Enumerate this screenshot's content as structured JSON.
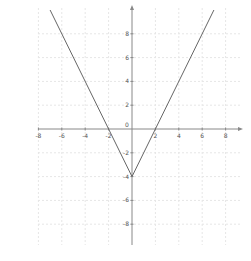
{
  "chart_data": {
    "type": "line",
    "title": "",
    "xlabel": "",
    "ylabel": "",
    "function": "y = 2|x| - 4",
    "series": [
      {
        "name": "y = 2|x| - 4",
        "x": [
          -7,
          -2,
          0,
          2,
          7
        ],
        "y": [
          10,
          0,
          -4,
          0,
          10
        ]
      }
    ],
    "key_points": {
      "vertex": [
        0,
        -4
      ],
      "x_intercepts": [
        [
          -2,
          0
        ],
        [
          2,
          0
        ]
      ],
      "y_intercept": [
        0,
        -4
      ]
    },
    "xlim": [
      -10,
      10
    ],
    "ylim": [
      -10,
      10
    ],
    "x_ticks": [
      -8,
      -6,
      -4,
      -2,
      2,
      4,
      6,
      8
    ],
    "y_ticks": [
      8,
      6,
      4,
      2,
      -2,
      -4,
      -6,
      -8
    ],
    "x_tick_labels": [
      "-8",
      "-6",
      "-4",
      "-2",
      "2",
      "4",
      "6",
      "8"
    ],
    "y_tick_labels": [
      "8",
      "6",
      "4",
      "2",
      "-2",
      "-4",
      "-6",
      "-8"
    ],
    "origin_label": "0",
    "grid": true,
    "legend": "none"
  },
  "colors": {
    "curve": "#666666",
    "axis": "#888888",
    "grid": "#e6e6e6",
    "background": "#ffffff"
  },
  "corner_mark": "y"
}
